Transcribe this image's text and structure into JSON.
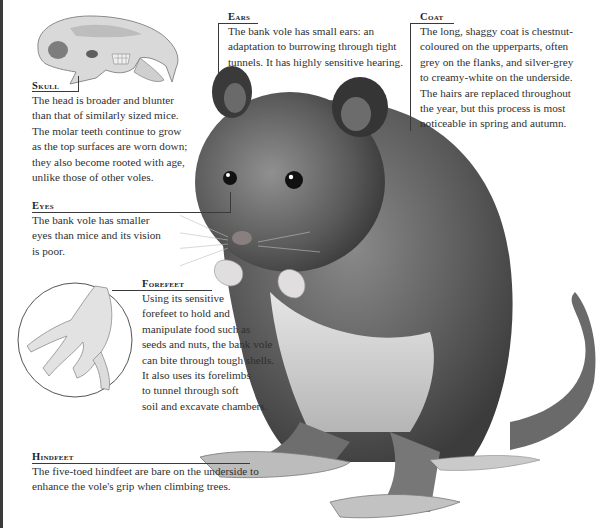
{
  "page": {
    "title_fragment": ""
  },
  "callouts": {
    "skull": {
      "heading": "Skull",
      "lines": [
        "The head is broader and blunter",
        "than that of similarly sized mice.",
        "The molar teeth continue to grow",
        "as the top surfaces are worn down;",
        "they also become rooted with age,",
        "unlike those of other voles."
      ]
    },
    "ears": {
      "heading": "Ears",
      "lines": [
        "The bank vole has small ears: an",
        "adaptation to burrowing through tight",
        "tunnels. It has highly sensitive hearing."
      ]
    },
    "coat": {
      "heading": "Coat",
      "lines": [
        "The long, shaggy coat is chestnut-",
        "coloured on the upperparts, often",
        "grey on the flanks, and silver-grey",
        "to creamy-white on the underside.",
        "The hairs are replaced throughout",
        "the year, but this process is most",
        "noticeable in spring and autumn."
      ]
    },
    "eyes": {
      "heading": "Eyes",
      "lines": [
        "The bank vole has smaller",
        "eyes than mice and its vision",
        "is poor."
      ]
    },
    "forefeet": {
      "heading": "Forefeet",
      "lines": [
        "Using its sensitive",
        "forefeet to hold and",
        "manipulate food such as",
        "seeds and nuts, the bank vole",
        "can bite through tough shells.",
        "It also uses its forelimbs",
        "to tunnel through soft",
        "soil and excavate chambers."
      ]
    },
    "hindfeet": {
      "heading": "Hindfeet",
      "lines": [
        "The five-toed hindfeet are bare on the underside to",
        "enhance the vole's grip when climbing trees."
      ]
    }
  },
  "illustrations": {
    "skull": "skull-illustration",
    "vole": "bank-vole-illustration",
    "forefoot_inset": "forefoot-inset-illustration"
  },
  "colors": {
    "text": "#2f2f2f",
    "rule": "#3a3a3a",
    "fur_dark": "#4a4a4a",
    "fur_mid": "#7a7a7a",
    "fur_light": "#cfcfcf"
  }
}
